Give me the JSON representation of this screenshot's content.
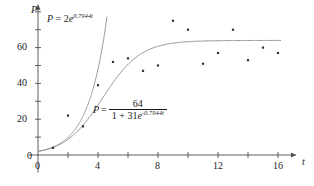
{
  "chart_data": {
    "type": "scatter",
    "title": "",
    "xlabel": "t",
    "ylabel": "P",
    "xlim": [
      -0.6,
      17.2
    ],
    "ylim": [
      -2,
      84
    ],
    "grid": false,
    "legend_position": "inline-annotations",
    "x_ticks_major": [
      0,
      4,
      8,
      12,
      16
    ],
    "x_ticks_minor": [
      2,
      6,
      10,
      14
    ],
    "y_ticks_major": [
      0,
      20,
      40,
      60
    ],
    "y_ticks_minor": [
      10,
      30,
      50,
      70
    ],
    "x_tick_labels": [
      "0",
      "4",
      "8",
      "12",
      "16"
    ],
    "y_tick_labels": [
      "0",
      "20",
      "40",
      "60"
    ],
    "series": [
      {
        "name": "observed-data",
        "type": "scatter",
        "marker": "small-square",
        "color": "#333333",
        "points": [
          {
            "t": 1,
            "P": 4
          },
          {
            "t": 2,
            "P": 22
          },
          {
            "t": 3,
            "P": 16
          },
          {
            "t": 4,
            "P": 39
          },
          {
            "t": 5,
            "P": 52
          },
          {
            "t": 6,
            "P": 54
          },
          {
            "t": 7,
            "P": 47
          },
          {
            "t": 8,
            "P": 50
          },
          {
            "t": 9,
            "P": 75
          },
          {
            "t": 10,
            "P": 70
          },
          {
            "t": 11,
            "P": 51
          },
          {
            "t": 12,
            "P": 57
          },
          {
            "t": 13,
            "P": 70
          },
          {
            "t": 14,
            "P": 53
          },
          {
            "t": 15,
            "P": 60
          },
          {
            "t": 16,
            "P": 57
          }
        ]
      },
      {
        "name": "exponential-model",
        "type": "line",
        "color": "#8c8c8c",
        "formula_plain": "P = 2e^(0.7944t)",
        "a": 2,
        "k": 0.7944,
        "t_range": [
          0,
          4.6
        ]
      },
      {
        "name": "logistic-model",
        "type": "line",
        "color": "#8c8c8c",
        "formula_plain": "P = 64 / (1 + 31e^(-0.7944t))",
        "L": 64,
        "b": 31,
        "k": 0.7944,
        "t_range": [
          0,
          16.2
        ]
      }
    ]
  },
  "axes": {
    "y_axis_label": "P",
    "x_axis_label": "t"
  },
  "annotations": {
    "exponential": {
      "lhs": "P",
      "equals": "=",
      "coefficient": "2",
      "base": "e",
      "exponent": "0.7944t"
    },
    "logistic": {
      "lhs": "P",
      "equals": "=",
      "numerator": "64",
      "denominator_prefix": "1 + 31",
      "denominator_base": "e",
      "denominator_exponent": "-0.7944t"
    }
  }
}
